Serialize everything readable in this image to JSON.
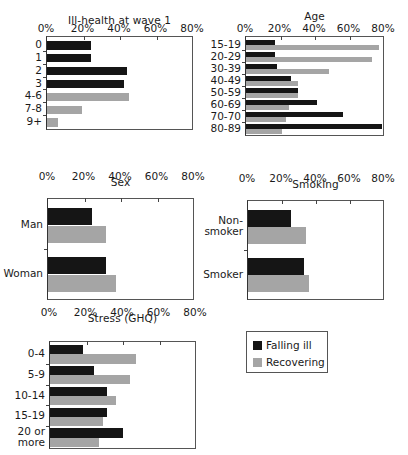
{
  "legend": {
    "items": [
      {
        "label": "Falling ill",
        "color": "#151515"
      },
      {
        "label": "Recovering",
        "color": "#a5a5a5"
      }
    ]
  },
  "axis_ticks": [
    "0%",
    "20%",
    "40%",
    "60%",
    "80%"
  ],
  "chart_data": [
    {
      "type": "bar",
      "orientation": "horizontal",
      "title": "Ill-health at wave 1",
      "categories": [
        "0",
        "1",
        "2",
        "3",
        "4-6",
        "7-8",
        "9+"
      ],
      "series": [
        {
          "name": "Falling ill",
          "values": [
            24,
            24,
            44,
            42,
            null,
            null,
            null
          ]
        },
        {
          "name": "Recovering",
          "values": [
            null,
            null,
            null,
            null,
            45,
            19,
            6
          ]
        }
      ],
      "xlim": [
        0,
        80
      ],
      "xticks": [
        "0%",
        "20%",
        "40%",
        "60%",
        "80%"
      ],
      "grid": false
    },
    {
      "type": "bar",
      "orientation": "horizontal",
      "title": "Age",
      "categories": [
        "15-19",
        "20-29",
        "30-39",
        "40-49",
        "50-59",
        "60-69",
        "70-70",
        "80-89"
      ],
      "series": [
        {
          "name": "Falling ill",
          "values": [
            17,
            17,
            18,
            26,
            30,
            41,
            56,
            79
          ]
        },
        {
          "name": "Recovering",
          "values": [
            77,
            73,
            48,
            30,
            30,
            25,
            23,
            21
          ]
        }
      ],
      "xlim": [
        0,
        80
      ],
      "xticks": [
        "0%",
        "20%",
        "40%",
        "60%",
        "80%"
      ],
      "grid": false
    },
    {
      "type": "bar",
      "orientation": "horizontal",
      "title": "Sex",
      "categories": [
        "Man",
        "Woman"
      ],
      "series": [
        {
          "name": "Falling ill",
          "values": [
            24,
            32
          ]
        },
        {
          "name": "Recovering",
          "values": [
            32,
            37
          ]
        }
      ],
      "xlim": [
        0,
        80
      ],
      "xticks": [
        "0%",
        "20%",
        "40%",
        "60%",
        "80%"
      ],
      "grid": false
    },
    {
      "type": "bar",
      "orientation": "horizontal",
      "title": "Smoking",
      "categories": [
        "Non-\nsmoker",
        "Smoker"
      ],
      "series": [
        {
          "name": "Falling ill",
          "values": [
            25,
            33
          ]
        },
        {
          "name": "Recovering",
          "values": [
            34,
            36
          ]
        }
      ],
      "xlim": [
        0,
        80
      ],
      "xticks": [
        "0%",
        "20%",
        "40%",
        "60%",
        "80%"
      ],
      "grid": false
    },
    {
      "type": "bar",
      "orientation": "horizontal",
      "title": "Stress (GHQ)",
      "categories": [
        "0-4",
        "5-9",
        "10-14",
        "15-19",
        "20 or\nmore"
      ],
      "series": [
        {
          "name": "Falling ill",
          "values": [
            18,
            24,
            31,
            31,
            40
          ]
        },
        {
          "name": "Recovering",
          "values": [
            47,
            44,
            36,
            29,
            27
          ]
        }
      ],
      "xlim": [
        0,
        80
      ],
      "xticks": [
        "0%",
        "20%",
        "40%",
        "60%",
        "80%"
      ],
      "grid": false
    }
  ]
}
